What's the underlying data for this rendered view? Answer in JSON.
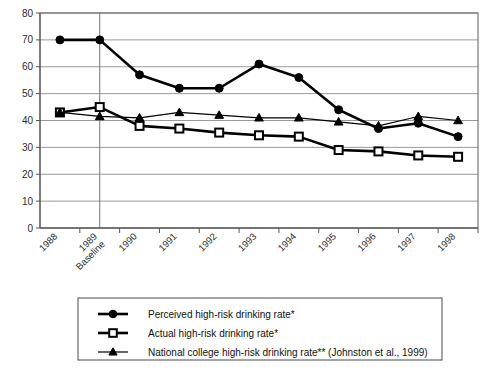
{
  "chart_data": {
    "type": "line",
    "title": "",
    "xlabel": "",
    "ylabel": "",
    "ylim": [
      0,
      80
    ],
    "yticks": [
      0,
      10,
      20,
      30,
      40,
      50,
      60,
      70,
      80
    ],
    "grid": true,
    "legend_position": "below-plot",
    "categories": [
      "1988",
      "1989 Baseline",
      "1990",
      "1991",
      "1992",
      "1993",
      "1994",
      "1995",
      "1996",
      "1997",
      "1998"
    ],
    "xtick_labels": [
      "1988",
      "1989\nBaseline",
      "1990",
      "1991",
      "1992",
      "1993",
      "1994",
      "1995",
      "1996",
      "1997",
      "1998"
    ],
    "annotations": [
      "Baseline marker line at 1989"
    ],
    "series": [
      {
        "name": "Perceived high-risk drinking rate*",
        "marker": "filled-circle",
        "values": [
          70,
          70,
          57,
          52,
          52,
          61,
          56,
          44,
          37,
          39,
          34
        ]
      },
      {
        "name": "Actual high-risk drinking rate*",
        "marker": "open-square",
        "values": [
          43,
          45,
          38,
          37,
          35.5,
          34.5,
          34,
          29,
          28.5,
          27,
          26.5
        ]
      },
      {
        "name": "National college high-risk drinking rate** (Johnston et al., 1999)",
        "marker": "filled-triangle",
        "values": [
          43,
          41.5,
          41,
          43,
          42,
          41,
          41,
          39.5,
          38,
          41.5,
          40
        ]
      }
    ]
  },
  "legend": {
    "items": [
      {
        "marker": "filled-circle",
        "label": "Perceived high-risk drinking rate*"
      },
      {
        "marker": "open-square",
        "label": "Actual high-risk drinking rate*"
      },
      {
        "marker": "filled-triangle",
        "label": "National college high-risk drinking rate** (Johnston et al., 1999)"
      }
    ]
  },
  "colors": {
    "series": "#000000",
    "grid": "#8d8d8d",
    "axis": "#555555",
    "background": "#ffffff"
  }
}
